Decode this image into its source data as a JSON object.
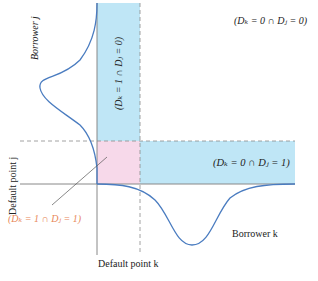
{
  "figure": {
    "labels": {
      "borrower_j": "Borrower j",
      "borrower_k": "Borrower k",
      "default_point_j": "Default point j",
      "default_point_k": "Default point k",
      "region_k1_j0": "(Dₖ = 1 ∩ Dⱼ = 0)",
      "region_k0_j0": "(Dₖ = 0 ∩ Dⱼ = 0)",
      "region_k0_j1": "(Dₖ = 0 ∩ Dⱼ = 1)",
      "region_k1_j1": "(Dₖ = 1 ∩ Dⱼ = 1)"
    },
    "colors": {
      "blue_region": "#bfe6f6",
      "pink_region": "#f7d9ea",
      "curve": "#4a7cc0",
      "axis": "#888888",
      "dashed": "#8a8a8a",
      "joint_default_label": "#e8875a"
    }
  }
}
